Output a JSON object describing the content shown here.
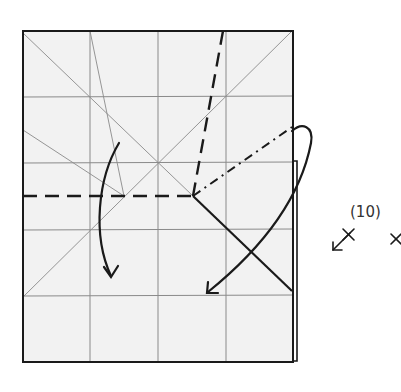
{
  "diagram": {
    "type": "origami-crease-pattern",
    "step_label": "(10)",
    "paper": {
      "fill": "#f2f2f2",
      "outline": "#1a1a1a",
      "grid_color": "#8a8a8a",
      "x": 23,
      "y": 31,
      "width": 270,
      "height": 331,
      "grid_columns": 4,
      "grid_rows": 5
    },
    "creases": {
      "valley_lines": [
        {
          "from": [
            23,
            196
          ],
          "to": [
            193,
            196
          ]
        },
        {
          "from": [
            223,
            31
          ],
          "to": [
            193,
            196
          ]
        },
        {
          "from": [
            193,
            196
          ],
          "to": [
            292,
            291
          ]
        }
      ],
      "mountain_lines": [
        {
          "from": [
            193,
            196
          ],
          "to": [
            292,
            127
          ]
        }
      ]
    },
    "arrows": [
      {
        "name": "left-fold-arrow",
        "direction": "down"
      },
      {
        "name": "right-fold-arrow",
        "direction": "down-left"
      }
    ],
    "symbols": [
      {
        "name": "arrow-with-x-symbol",
        "glyph": "↙×"
      },
      {
        "name": "x-symbol",
        "glyph": "×"
      }
    ]
  }
}
